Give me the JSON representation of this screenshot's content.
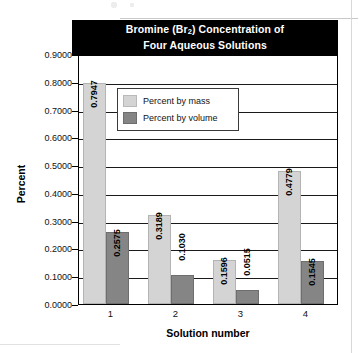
{
  "chart_data": {
    "type": "bar",
    "title": "Bromine (Br2) Concentration of Four Aqueous Solutions",
    "title_line1_pre": "Bromine (Br",
    "title_line1_sub": "2",
    "title_line1_post": ") Concentration of",
    "title_line2": "Four Aqueous Solutions",
    "xlabel": "Solution number",
    "ylabel": "Percent",
    "categories": [
      "1",
      "2",
      "3",
      "4"
    ],
    "series": [
      {
        "name": "Percent by mass",
        "color": "#d4d4d4",
        "values": [
          0.7947,
          0.3189,
          0.1596,
          0.4779
        ],
        "labels": [
          "0.7947",
          "0.3189",
          "0.1596",
          "0.4779"
        ]
      },
      {
        "name": "Percent by volume",
        "color": "#858585",
        "values": [
          0.2575,
          0.103,
          0.0515,
          0.1545
        ],
        "labels": [
          "0.2575",
          "0.1030",
          "0.0515",
          "0.1545"
        ]
      }
    ],
    "ylim": [
      0.0,
      0.9
    ],
    "ytick_labels": [
      "0.9000",
      "0.8000",
      "0.7000",
      "0.6000",
      "0.5000",
      "0.4000",
      "0.3000",
      "0.2000",
      "0.1000",
      "0.0000"
    ],
    "ytick_values": [
      0.9,
      0.8,
      0.7,
      0.6,
      0.5,
      0.4,
      0.3,
      0.2,
      0.1,
      0.0
    ],
    "grid": true,
    "legend_position": "inside-top-left",
    "legend_entries": [
      "Percent by mass",
      "Percent by volume"
    ],
    "colors": {
      "mass": "#d4d4d4",
      "volume": "#858585",
      "title_banner_bg": "#000000",
      "title_banner_text": "#ffffff",
      "axis": "#000000"
    }
  }
}
